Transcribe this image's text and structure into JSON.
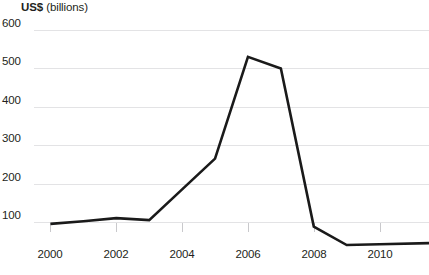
{
  "title": {
    "unit": "US$",
    "qualifier": " (billions)"
  },
  "axes": {
    "y_ticks": [
      "600",
      "500",
      "400",
      "300",
      "200",
      "100"
    ],
    "x_ticks": [
      "2000",
      "2002",
      "2004",
      "2006",
      "2008",
      "2010"
    ]
  },
  "colors": {
    "line": "#1a1a1a",
    "gridline": "#e3e3e5",
    "text": "#231f20",
    "background": "#ffffff"
  },
  "chart_data": {
    "type": "line",
    "title": "US$ (billions)",
    "xlabel": "",
    "ylabel": "US$ (billions)",
    "xlim": [
      1999.5,
      2011.5
    ],
    "ylim": [
      0,
      600
    ],
    "yticks": [
      100,
      200,
      300,
      400,
      500,
      600
    ],
    "xticks": [
      2000,
      2002,
      2004,
      2006,
      2008,
      2010
    ],
    "grid": true,
    "legend": false,
    "x": [
      2000,
      2001,
      2002,
      2003,
      2004,
      2005,
      2006,
      2007,
      2008,
      2009,
      2010,
      2011.5
    ],
    "values": [
      95,
      102,
      110,
      105,
      185,
      265,
      530,
      500,
      88,
      40,
      42,
      45
    ],
    "series": [
      {
        "name": "US$ (billions)",
        "values": [
          95,
          102,
          110,
          105,
          185,
          265,
          530,
          500,
          88,
          40,
          42,
          45
        ]
      }
    ]
  }
}
